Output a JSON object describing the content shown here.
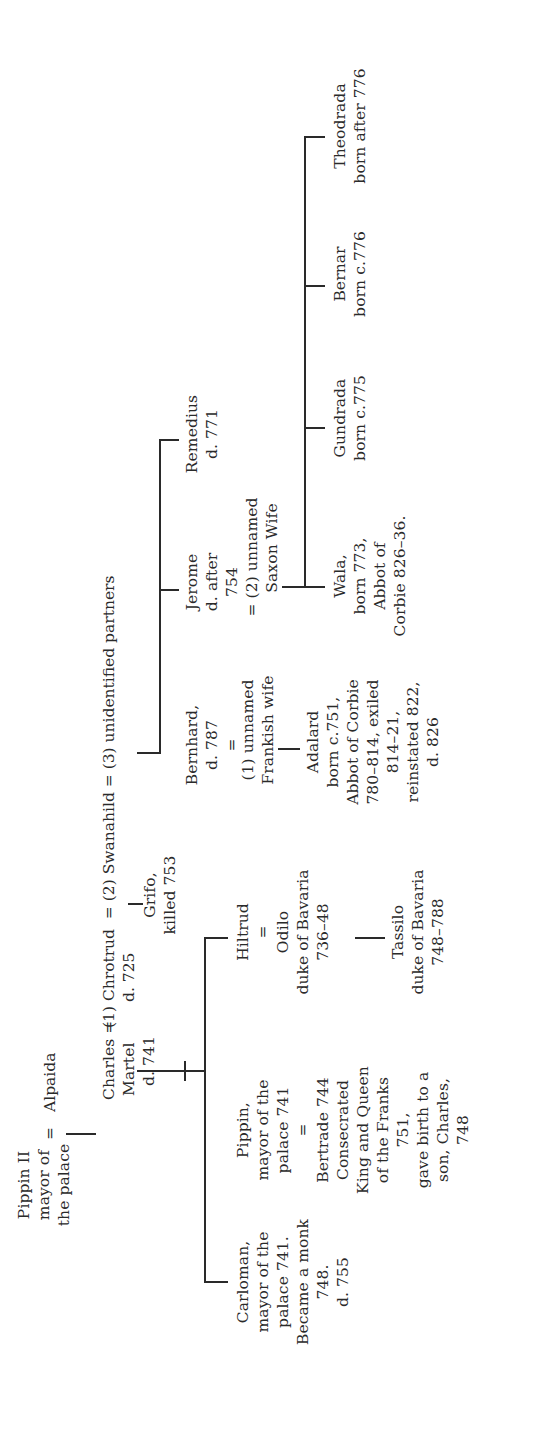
{
  "colors": {
    "ink": "#2a2a2a",
    "background": "#ffffff"
  },
  "generation1": {
    "pippin_ii": [
      "Pippin II",
      "mayor of",
      "the palace"
    ],
    "marriage_sign": "=",
    "alpaida": [
      "Alpaida"
    ]
  },
  "generation2": {
    "charles": [
      "Charles =",
      "Martel",
      "d. 741"
    ],
    "spouse_line": "(1) Chrotrud  = (2) Swanahild = (3) unidentified partners",
    "chrotrud_death": "d. 725",
    "grifo": [
      "Grifo,",
      "killed 753"
    ]
  },
  "generation3": {
    "carloman": [
      "Carloman,",
      "mayor of the",
      "palace 741.",
      "Became a monk",
      "748.",
      "d. 755"
    ],
    "pippin": [
      "Pippin,",
      "mayor of the",
      "palace 741",
      "=",
      "Bertrade 744",
      "Consecrated",
      "King and Queen",
      "of the Franks",
      "751,",
      "gave birth to a",
      "son, Charles,",
      "748"
    ],
    "hiltrud": [
      "Hiltrud",
      "=",
      "Odilo",
      "duke of Bavaria",
      "736–48"
    ],
    "bernhard": [
      "Bernhard,",
      "d. 787",
      "="
    ],
    "frankish_wife": [
      "(1) unnamed",
      "Frankish wife"
    ],
    "jerome": [
      "Jerome",
      "d. after",
      "754"
    ],
    "saxon_wife": [
      "= (2) unnamed",
      "Saxon Wife"
    ],
    "remedius": [
      "Remedius",
      "d. 771"
    ]
  },
  "generation4": {
    "tassilo": [
      "Tassilo",
      "duke of Bavaria",
      "748–788"
    ],
    "adalard": [
      "Adalard",
      "born c.751,",
      "Abbot of Corbie",
      "780–814, exiled",
      "814–21,",
      "reinstated 822,",
      "d. 826"
    ],
    "wala": [
      "Wala,",
      "born 773,",
      "Abbot of",
      "Corbie 826–36."
    ],
    "gundrada": [
      "Gundrada",
      "born c.775"
    ],
    "bernar": [
      "Bernar",
      "born c.776"
    ],
    "theodrada": [
      "Theodrada",
      "born after 776"
    ]
  }
}
